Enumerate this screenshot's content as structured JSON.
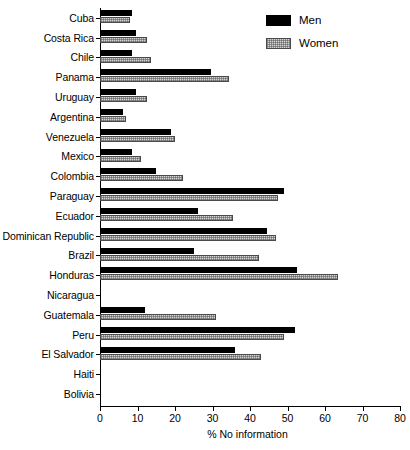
{
  "chart_data": {
    "type": "bar",
    "orientation": "horizontal",
    "title": "",
    "xlabel": "% No information",
    "ylabel": "",
    "xlim": [
      0,
      80
    ],
    "xticks": [
      0,
      10,
      20,
      30,
      40,
      50,
      60,
      70,
      80
    ],
    "xtick_labels": [
      "0",
      "10",
      "20",
      "30",
      "40",
      "50",
      "60",
      "70",
      "80"
    ],
    "grid": false,
    "legend_position": "top-right",
    "categories": [
      "Cuba",
      "Costa Rica",
      "Chile",
      "Panama",
      "Uruguay",
      "Argentina",
      "Venezuela",
      "Mexico",
      "Colombia",
      "Paraguay",
      "Ecuador",
      "Dominican Republic",
      "Brazil",
      "Honduras",
      "Nicaragua",
      "Guatemala",
      "Peru",
      "El Salvador",
      "Haiti",
      "Bolivia"
    ],
    "series": [
      {
        "name": "Men",
        "color": "#000000",
        "values": [
          8.5,
          9.5,
          8.5,
          29.5,
          9.5,
          6.0,
          19.0,
          8.5,
          15.0,
          49.0,
          26.0,
          44.5,
          25.0,
          52.5,
          0,
          12.0,
          52.0,
          36.0,
          0,
          0
        ]
      },
      {
        "name": "Women",
        "color": "#d4d4d4",
        "values": [
          8.0,
          12.5,
          13.5,
          34.5,
          12.5,
          7.0,
          20.0,
          11.0,
          22.0,
          47.5,
          35.5,
          47.0,
          42.5,
          63.5,
          0,
          31.0,
          49.0,
          43.0,
          0,
          0
        ]
      }
    ]
  },
  "legend": {
    "items": [
      {
        "label": "Men"
      },
      {
        "label": "Women"
      }
    ]
  },
  "axis": {
    "x_title": "% No information"
  }
}
